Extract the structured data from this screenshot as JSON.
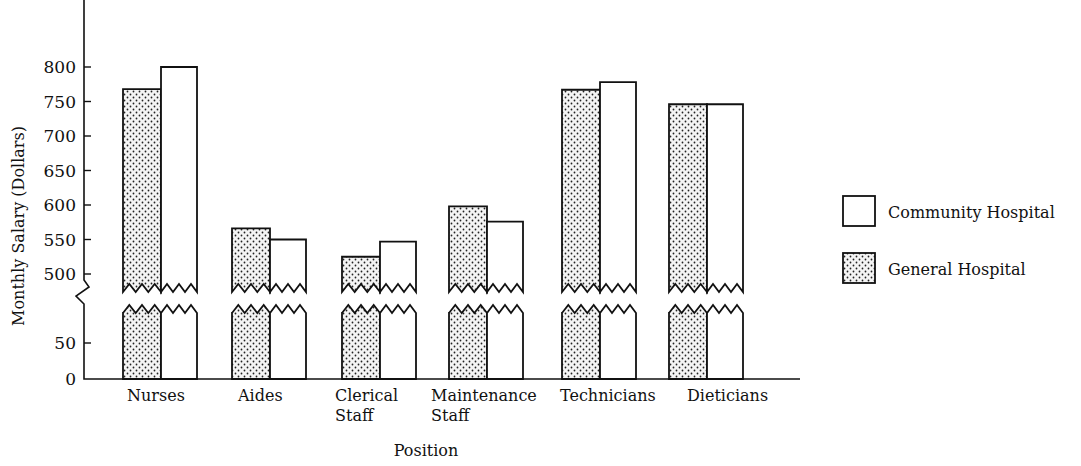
{
  "chart_data": {
    "type": "bar",
    "title": "",
    "xlabel": "Position",
    "ylabel": "Monthly Salary (Dollars)",
    "categories": [
      "Nurses",
      "Aides",
      "Clerical Staff",
      "Maintenance Staff",
      "Technicians",
      "Dieticians"
    ],
    "category_lines": [
      [
        "Nurses"
      ],
      [
        "Aides"
      ],
      [
        "Clerical",
        "Staff"
      ],
      [
        "Maintenance",
        "Staff"
      ],
      [
        "Technicians"
      ],
      [
        "Dieticians"
      ]
    ],
    "series": [
      {
        "name": "General Hospital",
        "pattern": "dotted",
        "values": [
          768,
          566,
          525,
          598,
          767,
          746
        ]
      },
      {
        "name": "Community Hospital",
        "pattern": "plain",
        "values": [
          800,
          550,
          547,
          576,
          778,
          746
        ]
      }
    ],
    "yticks_upper": [
      500,
      550,
      600,
      650,
      700,
      750,
      800
    ],
    "yticks_lower": [
      0,
      50
    ],
    "axis_break": "between 50 and 500",
    "ylim": [
      0,
      800
    ],
    "grid": false,
    "legend_position": "right",
    "legend": [
      {
        "label": "Community Hospital",
        "pattern": "plain"
      },
      {
        "label": "General Hospital",
        "pattern": "dotted"
      }
    ]
  }
}
